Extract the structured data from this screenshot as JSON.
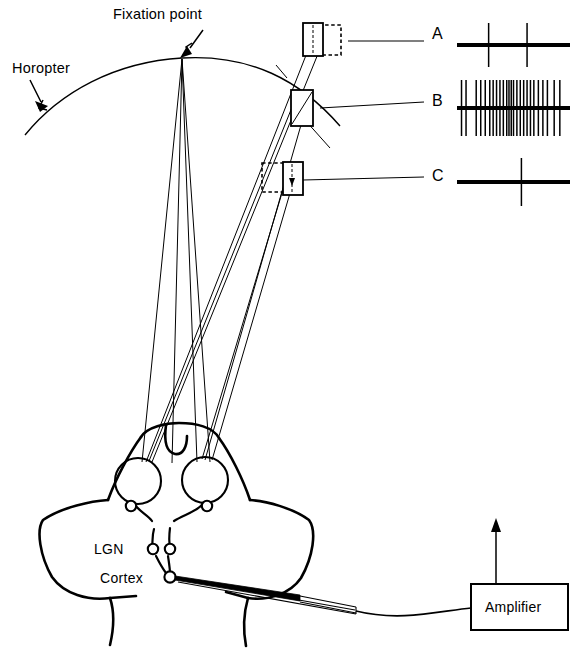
{
  "figure": {
    "caption_fragment": ""
  },
  "labels": {
    "horopter": "Horopter",
    "fixation_point": "Fixation point",
    "lgn": "LGN",
    "cortex": "Cortex",
    "amplifier": "Amplifier"
  },
  "traces": [
    {
      "id": "A",
      "label": "A",
      "condition": "crossed-disparity stimulus, far box dashed at right",
      "spike_count": 2,
      "spike_positions_pct": [
        28,
        62
      ],
      "baseline_y": 45,
      "x_start": 457,
      "x_end": 570,
      "spike_half_height": 22
    },
    {
      "id": "B",
      "label": "B",
      "condition": "zero-disparity stimulus on horopter",
      "spike_count": 25,
      "spike_positions_pct": [
        4,
        8,
        17,
        21,
        25,
        29,
        32,
        35,
        38,
        41,
        44,
        46,
        48,
        50,
        53,
        56,
        59,
        62,
        65,
        68,
        72,
        76,
        80,
        86,
        91
      ],
      "baseline_y": 108,
      "x_start": 457,
      "x_end": 570,
      "spike_half_height": 28
    },
    {
      "id": "C",
      "label": "C",
      "condition": "uncrossed-disparity stimulus, near box dashed at left",
      "spike_count": 1,
      "spike_positions_pct": [
        57
      ],
      "baseline_y": 182,
      "x_start": 457,
      "x_end": 570,
      "spike_half_height": 24
    }
  ],
  "stimuli": [
    {
      "id": "A",
      "name": "stimulus-box-a",
      "solid_box": {
        "x": 303,
        "y": 23,
        "w": 20,
        "h": 33
      },
      "dashed_box": {
        "x": 319,
        "y": 25,
        "w": 22,
        "h": 30
      }
    },
    {
      "id": "B",
      "name": "stimulus-box-b",
      "solid_box": {
        "x": 291,
        "y": 90,
        "w": 22,
        "h": 36
      },
      "dashed_box": null
    },
    {
      "id": "C",
      "name": "stimulus-box-c",
      "solid_box": {
        "x": 283,
        "y": 162,
        "w": 20,
        "h": 33
      },
      "dashed_box": {
        "x": 262,
        "y": 163,
        "w": 24,
        "h": 29
      }
    }
  ],
  "anatomy": {
    "eye_left": {
      "cx": 138,
      "cy": 481,
      "r": 23
    },
    "eye_right": {
      "cx": 205,
      "cy": 480,
      "r": 23
    },
    "lgn_nodes": 2,
    "cortex_nodes": 1
  },
  "amplifier": {
    "box": {
      "x": 471,
      "y": 584,
      "w": 97,
      "h": 46
    },
    "output_arrow": "up"
  }
}
